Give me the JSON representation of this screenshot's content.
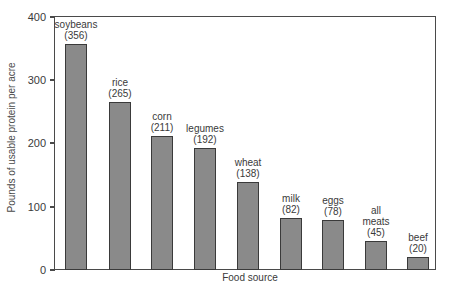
{
  "chart_data": {
    "type": "bar",
    "title": "",
    "xlabel": "Food source",
    "ylabel": "Pounds of usable protein per acre",
    "categories": [
      "soybeans",
      "rice",
      "corn",
      "legumes",
      "wheat",
      "milk",
      "eggs",
      "all meats",
      "beef"
    ],
    "values": [
      356,
      265,
      211,
      192,
      138,
      82,
      78,
      45,
      20
    ],
    "value_labels": [
      "(356)",
      "(265)",
      "(211)",
      "(192)",
      "(138)",
      "(82)",
      "(78)",
      "(45)",
      "(20)"
    ],
    "ylim": [
      0,
      400
    ],
    "yticks": [
      0,
      100,
      200,
      300,
      400
    ],
    "grid": false,
    "legend": null,
    "bar_color": "#8a8a8a",
    "edge_color": "#3a3a3a"
  },
  "axes": {
    "x_title": "Food source",
    "y_title": "Pounds of usable protein per acre",
    "y_tick_labels": [
      "0",
      "100",
      "200",
      "300",
      "400"
    ]
  },
  "bars": [
    {
      "name": "soybeans",
      "label_line1": "soybeans",
      "label_line2": "(356)",
      "value": 356
    },
    {
      "name": "rice",
      "label_line1": "rice",
      "label_line2": "(265)",
      "value": 265
    },
    {
      "name": "corn",
      "label_line1": "corn",
      "label_line2": "(211)",
      "value": 211
    },
    {
      "name": "legumes",
      "label_line1": "legumes",
      "label_line2": "(192)",
      "value": 192
    },
    {
      "name": "wheat",
      "label_line1": "wheat",
      "label_line2": "(138)",
      "value": 138
    },
    {
      "name": "milk",
      "label_line1": "milk",
      "label_line2": "(82)",
      "value": 82
    },
    {
      "name": "eggs",
      "label_line1": "eggs",
      "label_line2": "(78)",
      "value": 78
    },
    {
      "name": "all meats",
      "label_line1": "all",
      "label_line2": "meats",
      "label_line3": "(45)",
      "value": 45
    },
    {
      "name": "beef",
      "label_line1": "beef",
      "label_line2": "(20)",
      "value": 20
    }
  ]
}
